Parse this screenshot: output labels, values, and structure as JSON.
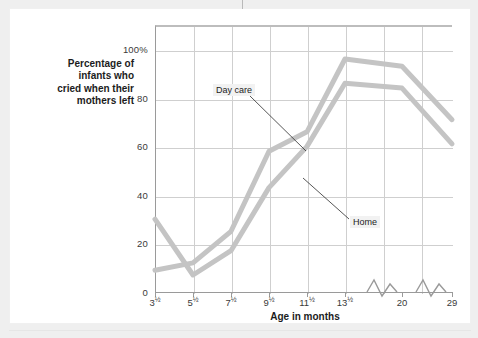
{
  "chart_data": {
    "type": "line",
    "title": "",
    "xlabel": "Age in months",
    "ylabel": "Percentage of\ninfants who\ncried when their\nmothers left",
    "ylabel_lines": [
      "Percentage of",
      "infants who",
      "cried when their",
      "mothers left"
    ],
    "categories": [
      "3½",
      "5½",
      "7½",
      "9½",
      "11½",
      "13½",
      "20",
      "29"
    ],
    "category_parts": [
      {
        "num": "3",
        "frac": "½"
      },
      {
        "num": "5",
        "frac": "½"
      },
      {
        "num": "7",
        "frac": "½"
      },
      {
        "num": "9",
        "frac": "½"
      },
      {
        "num": "11",
        "frac": "½"
      },
      {
        "num": "13",
        "frac": "½"
      },
      {
        "num": "20",
        "frac": ""
      },
      {
        "num": "29",
        "frac": ""
      }
    ],
    "ylim": [
      0,
      110
    ],
    "yticks": [
      0,
      20,
      40,
      60,
      80,
      100
    ],
    "ytick_labels": [
      "0",
      "20",
      "40",
      "60",
      "80",
      "100%"
    ],
    "grid": true,
    "legend": "callout-labels",
    "axis_breaks": [
      "between 13½ and 20",
      "between 20 and 29"
    ],
    "series": [
      {
        "name": "Day care",
        "color": "#c4c4c4",
        "values": [
          9,
          12,
          25,
          58,
          66,
          96,
          93,
          71
        ]
      },
      {
        "name": "Home",
        "color": "#c4c4c4",
        "values": [
          30,
          7,
          17,
          43,
          60,
          86,
          84,
          61
        ]
      }
    ],
    "annotations": [
      {
        "text": "Day care",
        "points_to_series": "Day care"
      },
      {
        "text": "Home",
        "points_to_series": "Home"
      }
    ]
  },
  "colors": {
    "line": "#c4c4c4",
    "grid": "#cfcfcf",
    "axis": "#9a9a9a",
    "text": "#1c1c1c",
    "page_background": "#efefef",
    "card_background": "#ffffff"
  }
}
